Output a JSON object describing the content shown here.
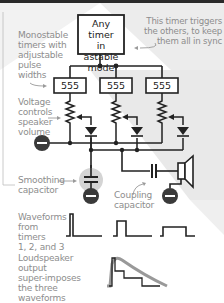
{
  "colors": {
    "line": "#222222",
    "label": "#8d8d8d",
    "shade": "#e9e9e9",
    "ground": "#3a3a3a",
    "highlight": "#cfcfcf"
  },
  "astable_box": {
    "text": "Any timer in astable mode",
    "line1": "Any timer",
    "line2": "in astable",
    "line3": "mode"
  },
  "timers": [
    {
      "label": "555"
    },
    {
      "label": "555"
    },
    {
      "label": "555"
    }
  ],
  "annotations": {
    "trigger": {
      "line1": "This timer triggers",
      "line2": "the others, to keep",
      "line3": "them all in sync"
    },
    "monostable": {
      "line1": "Monostable",
      "line2": "timers with",
      "line3": "adjustable",
      "line4": "pulse",
      "line5": "widths"
    },
    "voltage": {
      "line1": "Voltage",
      "line2": "controls",
      "line3": "speaker",
      "line4": "volume"
    },
    "smoothing": {
      "line1": "Smoothing",
      "line2": "capacitor"
    },
    "coupling": {
      "line1": "Coupling",
      "line2": "capacitor"
    },
    "waveforms": {
      "line1": "Waveforms",
      "line2": "from timers",
      "line3": "1, 2, and 3"
    },
    "loudspeaker": {
      "line1": "Loudspeaker",
      "line2": "output",
      "line3": "super-imposes",
      "line4": "the three waveforms"
    }
  },
  "components": {
    "potentiometers": 3,
    "diodes": 3,
    "ground_symbols": 3,
    "speaker": 1
  }
}
